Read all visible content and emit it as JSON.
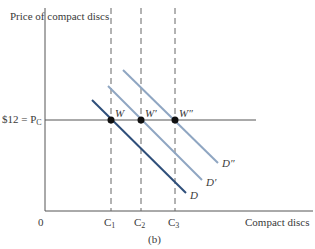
{
  "diagram": {
    "panel_label": "(b)",
    "y_axis_label": "Price of compact discs",
    "x_axis_label": "Compact discs",
    "origin_label": "0",
    "price_label_prefix": "$12 = P",
    "price_label_sub": "C",
    "quantity_ticks": [
      {
        "base": "C",
        "sub": "1"
      },
      {
        "base": "C",
        "sub": "2"
      },
      {
        "base": "C",
        "sub": "3"
      }
    ],
    "points": [
      {
        "label": "W"
      },
      {
        "label": "W′"
      },
      {
        "label": "W″"
      }
    ],
    "curves": [
      {
        "label": "D",
        "color": "#2f4f7a"
      },
      {
        "label": "D′",
        "color": "#8fa6c2"
      },
      {
        "label": "D″",
        "color": "#8fa6c2"
      }
    ],
    "axis_color": "#555555",
    "dash_color": "#666666"
  }
}
